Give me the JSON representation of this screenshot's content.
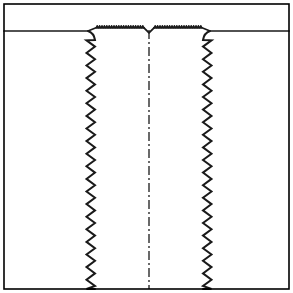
{
  "figure": {
    "domain": "Diagram",
    "kind": "technical-cross-section-line-drawing",
    "title": "",
    "caption": "",
    "width": 293,
    "height": 293,
    "background_color": "#ffffff"
  },
  "colors": {
    "ink": "#1a1a1a",
    "outline": "#000000",
    "paper": "#ffffff",
    "stipple_dot": "#4a4a4a",
    "stipple_background": "#ffffff",
    "stipple_apparent_gray": "#d8d8d8"
  },
  "frame": {
    "name": "outer-border",
    "x": 4,
    "y": 4,
    "width": 285,
    "height": 285,
    "stroke_width": 1.6,
    "fill": "none"
  },
  "regions": [
    {
      "id": "upper-void",
      "label": "upper open space",
      "fill": "paper",
      "description": "blank white band across the top of the frame above the material surface"
    },
    {
      "id": "material-left",
      "label": "left material body",
      "fill": "stipple",
      "description": "stippled solid body occupying the left portion below the top surface"
    },
    {
      "id": "material-right",
      "label": "right material body",
      "fill": "stipple",
      "description": "stippled solid body occupying the right portion below the top surface"
    },
    {
      "id": "channel",
      "label": "central channel / groove",
      "fill": "paper",
      "description": "white vertical channel between the two serrated sidewalls, open to the bottom"
    }
  ],
  "geometry": {
    "top_surface_y": 31,
    "channel_left_x": 95,
    "channel_right_x": 203,
    "channel_bottom_y": 289,
    "centerline_x": 149
  },
  "top_surface": {
    "name": "top-surface",
    "label": "knurled / serrated top surface",
    "left_flat_end_x": 88,
    "right_flat_start_x": 210,
    "knurl_start_x": 96,
    "knurl_end_x": 202,
    "knurl_tooth_count": 40,
    "knurl_amplitude": 2.2,
    "stroke_width": 1.6,
    "notch": {
      "name": "center-notch",
      "label": "small v-notch at surface center",
      "x": 149,
      "depth": 5,
      "half_width": 5
    }
  },
  "sidewalls": [
    {
      "name": "left-sidewall",
      "label": "left serrated sidewall",
      "side": "left",
      "base_x": 95,
      "top_y": 34,
      "bottom_y": 289,
      "tooth_period": 12.6,
      "tooth_amplitude": 8.5,
      "tooth_count": 20,
      "stroke_width": 2.0,
      "shoulder": {
        "label": "top shoulder fillet",
        "from_x": 88,
        "from_y": 31,
        "to_x": 95,
        "to_y": 40
      }
    },
    {
      "name": "right-sidewall",
      "label": "right serrated sidewall",
      "side": "right",
      "base_x": 203,
      "top_y": 34,
      "bottom_y": 289,
      "tooth_period": 12.6,
      "tooth_amplitude": 8.5,
      "tooth_count": 20,
      "stroke_width": 2.0,
      "shoulder": {
        "label": "top shoulder fillet",
        "from_x": 210,
        "from_y": 31,
        "to_x": 203,
        "to_y": 40
      }
    }
  ],
  "centerline": {
    "name": "centerline",
    "label": "dash-dot axis of symmetry",
    "x": 149,
    "top_y": 30,
    "bottom_y": 289,
    "stroke_width": 1.3,
    "dash_pattern": "9 3 2 3"
  },
  "annotations": {
    "labels": [],
    "dimensions": [],
    "leaders": [],
    "text_present": false,
    "note": "figure contains no visible text, numbers, axis ticks or legend"
  }
}
